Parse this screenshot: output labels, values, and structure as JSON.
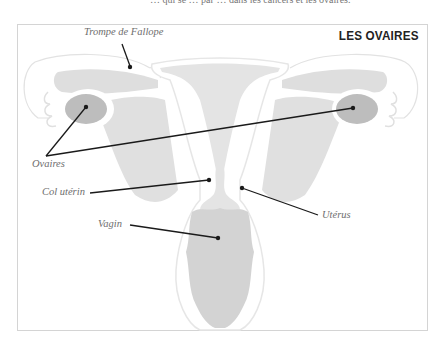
{
  "header": {
    "cut_text": "… qui se … par … dans les cancers et les ovaires."
  },
  "diagram": {
    "title": "LES OVAIRES",
    "labels": {
      "fallopian_tube": "Trompe de Fallope",
      "ovaries": "Ovaires",
      "cervix": "Col utérin",
      "vagina": "Vagin",
      "uterus": "Utérus"
    },
    "colors": {
      "background": "#ffffff",
      "outline": "#e6e6e6",
      "tissue_light": "#e3e3e3",
      "tissue_mid": "#d6d6d6",
      "ovary": "#bdbdbd",
      "leader_line": "#1a1a1a",
      "label_text": "#6e6e6e",
      "title_text": "#222222"
    }
  }
}
